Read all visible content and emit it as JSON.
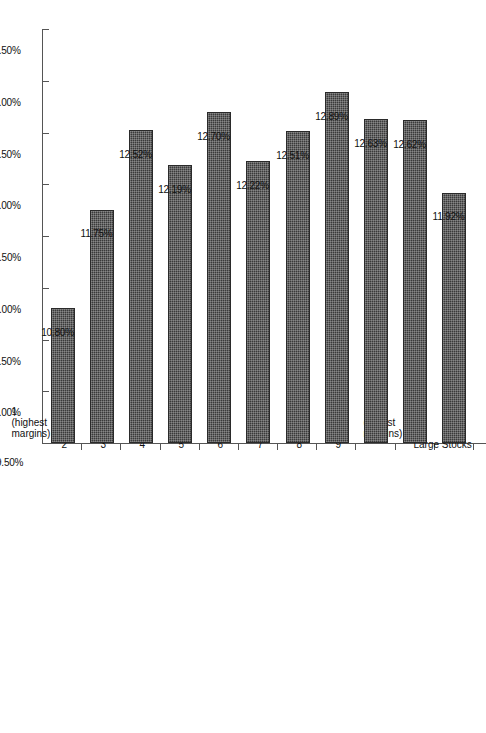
{
  "chart_data": {
    "type": "bar",
    "orientation": "horizontal",
    "title": "",
    "subtitle": "",
    "xlabel": "",
    "ylabel": "",
    "grid": false,
    "legend": "none",
    "axis_ticks": [
      "13.50%",
      "13.00%",
      "12.50%",
      "12.00%",
      "11.50%",
      "11.00%",
      "10.50%",
      "10.00%",
      "9.50%"
    ],
    "axis_tick_values": [
      13.5,
      13.0,
      12.5,
      12.0,
      11.5,
      11.0,
      10.5,
      10.0,
      9.5
    ],
    "xlim": [
      13.5,
      9.5
    ],
    "axis_reversed": true,
    "baseline": 9.5,
    "categories": [
      "1 (highest margins)",
      "2",
      "3",
      "4",
      "5",
      "6",
      "7",
      "8",
      "9",
      "10 (lowest margins)",
      "Large Stocks"
    ],
    "values": [
      10.8,
      11.75,
      12.52,
      12.19,
      12.7,
      12.22,
      12.51,
      12.89,
      12.63,
      12.62,
      11.92
    ],
    "value_labels": [
      "10.80%",
      "11.75%",
      "12.52%",
      "12.19%",
      "12.70%",
      "12.22%",
      "12.51%",
      "12.89%",
      "12.63%",
      "12.62%",
      "11.92%"
    ],
    "bar_color": "#3a3a3a",
    "background_color": "#ffffff",
    "axis_color": "#555555"
  }
}
